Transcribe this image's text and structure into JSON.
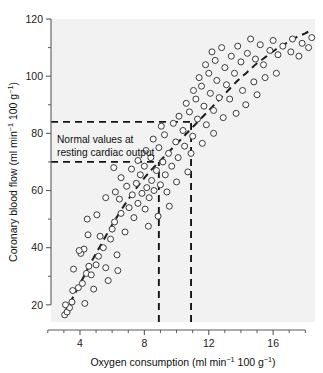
{
  "chart_data": {
    "type": "scatter",
    "title": "",
    "xlabel": "Oxygen consumption (ml min⁻¹ 100 g⁻¹)",
    "ylabel": "Coronary blood flow (ml min⁻¹ 100 g⁻¹)",
    "xlabel_parts": {
      "main": "Oxygen consumption (ml min",
      "sup1": "−1",
      "mid": " 100 g",
      "sup2": "−1",
      "end": ")"
    },
    "ylabel_parts": {
      "main": "Coronary blood flow (ml min",
      "sup1": "−1",
      "mid": " 100 g",
      "sup2": "−1",
      "end": ")"
    },
    "xlim": [
      2.2,
      18.6
    ],
    "ylim": [
      14,
      120
    ],
    "xticks": [
      4,
      8,
      12,
      16
    ],
    "yticks": [
      20,
      40,
      60,
      80,
      100,
      120
    ],
    "xticklabels": [
      "4",
      "8",
      "12",
      "16"
    ],
    "yticklabels": [
      "20",
      "40",
      "60",
      "80",
      "100",
      "120"
    ],
    "x_minor_ticks": [
      2,
      3,
      5,
      6,
      7,
      9,
      10,
      11,
      13,
      14,
      15,
      17,
      18
    ],
    "y_minor_ticks": [
      30,
      50,
      70,
      90,
      110
    ],
    "grid": false,
    "legend": null,
    "legend_position": "none",
    "marker_style": "open-circle",
    "marker_radius": 3.0,
    "annotations": [
      {
        "name": "normal-values-note",
        "line1": "Normal values at",
        "line2": "resting cardiac output",
        "x": 3.1,
        "y": 79
      }
    ],
    "reference_lines": [
      {
        "name": "upper-horizontal-reference",
        "orientation": "horizontal",
        "value": 84.0,
        "x_start": 2.2,
        "x_end": 11.0,
        "style": "dashed"
      },
      {
        "name": "lower-horizontal-reference",
        "orientation": "horizontal",
        "value": 70.0,
        "x_start": 2.2,
        "x_end": 8.9,
        "style": "dashed"
      },
      {
        "name": "left-vertical-reference",
        "orientation": "vertical",
        "value": 8.9,
        "y_start": 14,
        "y_end": 70.0,
        "style": "dashed"
      },
      {
        "name": "right-vertical-reference",
        "orientation": "vertical",
        "value": 10.9,
        "y_start": 14,
        "y_end": 84.0,
        "style": "dashed"
      }
    ],
    "trend_line": {
      "name": "fitted-dashed-trend-curve",
      "style": "dashed",
      "points": [
        [
          3.0,
          17.0
        ],
        [
          3.6,
          23.0
        ],
        [
          4.2,
          29.5
        ],
        [
          4.8,
          36.0
        ],
        [
          5.4,
          42.0
        ],
        [
          6.0,
          48.0
        ],
        [
          6.6,
          53.5
        ],
        [
          7.2,
          58.5
        ],
        [
          7.8,
          63.0
        ],
        [
          8.4,
          67.0
        ],
        [
          9.0,
          70.5
        ],
        [
          9.6,
          74.0
        ],
        [
          10.2,
          77.5
        ],
        [
          10.8,
          81.0
        ],
        [
          11.4,
          84.5
        ],
        [
          12.0,
          88.0
        ],
        [
          12.6,
          91.5
        ],
        [
          13.2,
          95.0
        ],
        [
          13.8,
          98.5
        ],
        [
          14.4,
          101.5
        ],
        [
          15.0,
          104.5
        ],
        [
          15.6,
          107.0
        ],
        [
          16.2,
          109.5
        ],
        [
          16.8,
          111.5
        ],
        [
          17.4,
          113.5
        ],
        [
          18.0,
          115.0
        ],
        [
          18.3,
          116.0
        ]
      ]
    },
    "points": [
      [
        3.05,
        16.5
      ],
      [
        3.2,
        17.5
      ],
      [
        3.35,
        19.0
      ],
      [
        3.5,
        21.0
      ],
      [
        3.1,
        20.0
      ],
      [
        4.3,
        20.5
      ],
      [
        3.55,
        25.0
      ],
      [
        3.9,
        26.0
      ],
      [
        4.15,
        27.5
      ],
      [
        4.4,
        31.0
      ],
      [
        3.6,
        32.5
      ],
      [
        4.7,
        30.5
      ],
      [
        4.55,
        33.5
      ],
      [
        5.0,
        34.0
      ],
      [
        5.6,
        33.0
      ],
      [
        4.05,
        38.0
      ],
      [
        4.25,
        39.5
      ],
      [
        3.95,
        39.0
      ],
      [
        5.15,
        37.0
      ],
      [
        5.45,
        40.0
      ],
      [
        6.3,
        37.5
      ],
      [
        4.5,
        44.5
      ],
      [
        5.25,
        44.0
      ],
      [
        5.9,
        43.0
      ],
      [
        6.0,
        46.5
      ],
      [
        6.8,
        45.5
      ],
      [
        4.45,
        50.0
      ],
      [
        5.05,
        51.5
      ],
      [
        6.15,
        49.0
      ],
      [
        6.55,
        52.0
      ],
      [
        7.35,
        50.5
      ],
      [
        7.05,
        54.0
      ],
      [
        7.6,
        55.5
      ],
      [
        8.05,
        53.5
      ],
      [
        6.45,
        57.0
      ],
      [
        7.25,
        58.5
      ],
      [
        7.85,
        59.0
      ],
      [
        8.3,
        57.5
      ],
      [
        5.6,
        57.5
      ],
      [
        6.2,
        59.5
      ],
      [
        6.9,
        61.5
      ],
      [
        7.5,
        62.5
      ],
      [
        8.15,
        61.0
      ],
      [
        8.6,
        60.0
      ],
      [
        6.55,
        64.5
      ],
      [
        7.75,
        65.5
      ],
      [
        8.45,
        63.5
      ],
      [
        9.0,
        62.0
      ],
      [
        7.2,
        67.5
      ],
      [
        8.0,
        68.5
      ],
      [
        8.75,
        67.0
      ],
      [
        9.3,
        65.5
      ],
      [
        6.1,
        68.0
      ],
      [
        7.6,
        70.5
      ],
      [
        8.4,
        71.5
      ],
      [
        9.15,
        70.0
      ],
      [
        9.7,
        68.5
      ],
      [
        8.1,
        74.0
      ],
      [
        8.9,
        75.0
      ],
      [
        9.5,
        73.0
      ],
      [
        10.1,
        71.5
      ],
      [
        8.55,
        78.0
      ],
      [
        9.25,
        79.5
      ],
      [
        9.95,
        77.0
      ],
      [
        10.5,
        75.5
      ],
      [
        9.05,
        82.5
      ],
      [
        9.8,
        83.5
      ],
      [
        10.4,
        81.0
      ],
      [
        11.0,
        79.0
      ],
      [
        10.15,
        86.0
      ],
      [
        10.8,
        87.5
      ],
      [
        11.3,
        85.0
      ],
      [
        11.85,
        83.0
      ],
      [
        10.6,
        90.5
      ],
      [
        11.2,
        92.0
      ],
      [
        11.7,
        89.5
      ],
      [
        12.3,
        88.0
      ],
      [
        11.05,
        95.0
      ],
      [
        11.55,
        96.5
      ],
      [
        12.1,
        94.0
      ],
      [
        12.65,
        92.5
      ],
      [
        11.4,
        99.5
      ],
      [
        12.0,
        101.0
      ],
      [
        12.5,
        98.5
      ],
      [
        13.1,
        97.0
      ],
      [
        11.8,
        104.0
      ],
      [
        12.4,
        105.5
      ],
      [
        13.0,
        103.0
      ],
      [
        13.6,
        101.0
      ],
      [
        12.2,
        108.5
      ],
      [
        12.8,
        110.0
      ],
      [
        13.4,
        107.0
      ],
      [
        14.0,
        105.0
      ],
      [
        13.8,
        110.5
      ],
      [
        14.4,
        108.0
      ],
      [
        14.9,
        106.0
      ],
      [
        15.4,
        104.0
      ],
      [
        14.6,
        113.0
      ],
      [
        15.2,
        111.0
      ],
      [
        15.8,
        109.0
      ],
      [
        16.3,
        107.5
      ],
      [
        16.0,
        112.5
      ],
      [
        16.6,
        110.5
      ],
      [
        17.1,
        108.5
      ],
      [
        17.6,
        107.0
      ],
      [
        17.2,
        113.0
      ],
      [
        17.8,
        111.5
      ],
      [
        18.2,
        110.0
      ],
      [
        18.4,
        113.5
      ],
      [
        13.3,
        92.0
      ],
      [
        14.1,
        95.0
      ],
      [
        14.8,
        98.0
      ],
      [
        15.5,
        99.5
      ],
      [
        16.2,
        101.0
      ],
      [
        12.9,
        85.5
      ],
      [
        13.7,
        87.0
      ],
      [
        14.3,
        90.0
      ],
      [
        15.0,
        93.5
      ],
      [
        10.9,
        73.0
      ],
      [
        11.6,
        76.5
      ],
      [
        12.3,
        80.0
      ],
      [
        9.4,
        59.5
      ],
      [
        10.0,
        63.0
      ],
      [
        10.7,
        66.5
      ],
      [
        5.75,
        28.5
      ],
      [
        6.35,
        32.0
      ],
      [
        4.85,
        25.5
      ],
      [
        8.25,
        47.5
      ],
      [
        8.85,
        51.0
      ],
      [
        9.55,
        54.5
      ]
    ]
  }
}
